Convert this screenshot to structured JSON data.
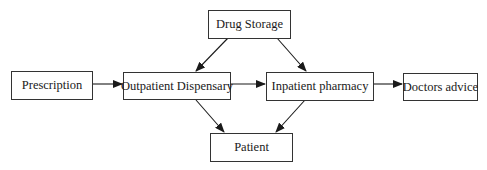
{
  "diagram": {
    "type": "flowchart",
    "nodes": [
      {
        "id": "drug_storage",
        "label": "Drug Storage"
      },
      {
        "id": "prescription",
        "label": "Prescription"
      },
      {
        "id": "outpatient",
        "label": "Outpatient Dispensary"
      },
      {
        "id": "inpatient",
        "label": "Inpatient pharmacy"
      },
      {
        "id": "doctors_advice",
        "label": "Doctors advice"
      },
      {
        "id": "patient",
        "label": "Patient"
      }
    ],
    "edges": [
      {
        "from": "drug_storage",
        "to": "outpatient"
      },
      {
        "from": "drug_storage",
        "to": "inpatient"
      },
      {
        "from": "prescription",
        "to": "outpatient"
      },
      {
        "from": "outpatient",
        "to": "inpatient"
      },
      {
        "from": "inpatient",
        "to": "doctors_advice"
      },
      {
        "from": "outpatient",
        "to": "patient"
      },
      {
        "from": "inpatient",
        "to": "patient"
      }
    ]
  }
}
